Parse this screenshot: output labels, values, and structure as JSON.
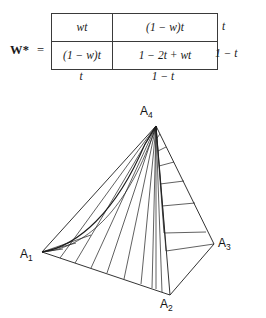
{
  "matrix": {
    "name": "W*",
    "equals": "=",
    "cells": [
      [
        "wt",
        "(1 − w)t"
      ],
      [
        "(1 − w)t",
        "1 − 2t + wt"
      ]
    ],
    "row_labels": [
      "t",
      "1 − t"
    ],
    "col_labels": [
      "t",
      "1 − t"
    ]
  },
  "tetrahedron": {
    "vertices": [
      {
        "id": "A1",
        "label": "A",
        "sub": "1"
      },
      {
        "id": "A2",
        "label": "A",
        "sub": "2"
      },
      {
        "id": "A3",
        "label": "A",
        "sub": "3"
      },
      {
        "id": "A4",
        "label": "A",
        "sub": "4"
      }
    ]
  },
  "colors": {
    "ink": "#1c1c1c",
    "rule": "#3a3a3a",
    "background": "#ffffff"
  }
}
